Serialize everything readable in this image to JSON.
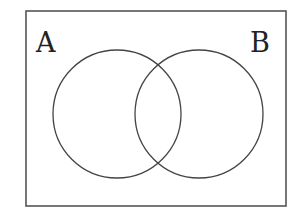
{
  "diagram": {
    "type": "venn",
    "universe": {
      "x": 26,
      "y": 11,
      "width": 260,
      "height": 195,
      "stroke": "#555555"
    },
    "sets": [
      {
        "name": "A",
        "label": "A",
        "cx": 117,
        "cy": 114,
        "r": 64,
        "label_x": 36,
        "label_y": 52
      },
      {
        "name": "B",
        "label": "B",
        "cx": 199,
        "cy": 114,
        "r": 64,
        "label_x": 250,
        "label_y": 52
      }
    ],
    "stroke_color": "#444444",
    "background": "#ffffff"
  }
}
